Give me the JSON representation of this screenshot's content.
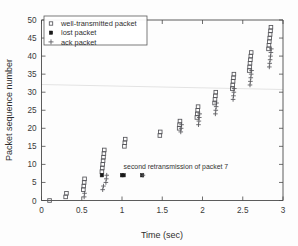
{
  "chart_data": {
    "type": "scatter",
    "title": "",
    "xlabel": "Time (sec)",
    "ylabel": "Packet sequence number",
    "xlim": [
      0,
      3
    ],
    "ylim": [
      0,
      50
    ],
    "xticks": [
      0,
      0.5,
      1,
      1.5,
      2,
      2.5,
      3
    ],
    "xticklabels": [
      "0",
      "0.5",
      "1",
      "1.5",
      "2",
      "2.5",
      "3"
    ],
    "yticks": [
      0,
      5,
      10,
      15,
      20,
      25,
      30,
      35,
      40,
      45,
      50
    ],
    "yticklabels": [
      "0",
      "5",
      "10",
      "15",
      "20",
      "25",
      "30",
      "35",
      "40",
      "45",
      "50"
    ],
    "grid": false,
    "legend_position": "upper left",
    "series": [
      {
        "name": "well-transmitted packet",
        "marker": "open-square",
        "color": "#55555a",
        "points": [
          [
            0.1,
            0
          ],
          [
            0.3,
            1
          ],
          [
            0.31,
            2
          ],
          [
            0.52,
            3
          ],
          [
            0.525,
            4
          ],
          [
            0.53,
            5
          ],
          [
            0.535,
            6
          ],
          [
            0.75,
            8
          ],
          [
            0.755,
            9
          ],
          [
            0.76,
            10
          ],
          [
            0.765,
            11
          ],
          [
            0.77,
            12
          ],
          [
            0.775,
            13
          ],
          [
            0.78,
            14
          ],
          [
            1.03,
            15
          ],
          [
            1.035,
            16
          ],
          [
            1.04,
            17
          ],
          [
            1.47,
            18
          ],
          [
            1.475,
            19
          ],
          [
            1.71,
            20
          ],
          [
            1.715,
            21
          ],
          [
            1.72,
            22
          ],
          [
            1.93,
            23
          ],
          [
            1.935,
            24
          ],
          [
            1.94,
            25
          ],
          [
            1.945,
            26
          ],
          [
            2.15,
            27
          ],
          [
            2.155,
            28
          ],
          [
            2.16,
            29
          ],
          [
            2.165,
            30
          ],
          [
            2.37,
            31
          ],
          [
            2.375,
            32
          ],
          [
            2.38,
            33
          ],
          [
            2.385,
            34
          ],
          [
            2.39,
            35
          ],
          [
            2.58,
            36
          ],
          [
            2.585,
            37
          ],
          [
            2.59,
            38
          ],
          [
            2.595,
            39
          ],
          [
            2.6,
            40
          ],
          [
            2.605,
            41
          ],
          [
            2.82,
            42
          ],
          [
            2.825,
            43
          ],
          [
            2.83,
            44
          ],
          [
            2.835,
            45
          ],
          [
            2.84,
            46
          ],
          [
            2.845,
            47
          ],
          [
            2.85,
            48
          ]
        ]
      },
      {
        "name": "lost packet",
        "marker": "filled-square",
        "color": "#1a1a1a",
        "points": [
          [
            0.75,
            7
          ],
          [
            1.0,
            7
          ],
          [
            1.02,
            7
          ],
          [
            1.25,
            7
          ]
        ]
      },
      {
        "name": "ack packet",
        "marker": "plus",
        "color": "#55555a",
        "points": [
          [
            0.53,
            1
          ],
          [
            0.535,
            2
          ],
          [
            0.76,
            3
          ],
          [
            0.77,
            4
          ],
          [
            0.8,
            5
          ],
          [
            0.805,
            6
          ],
          [
            0.81,
            7
          ],
          [
            1.26,
            7
          ],
          [
            1.73,
            19
          ],
          [
            1.735,
            20
          ],
          [
            1.74,
            21
          ],
          [
            1.95,
            21
          ],
          [
            1.955,
            22
          ],
          [
            1.96,
            23
          ],
          [
            1.965,
            24
          ],
          [
            2.16,
            24
          ],
          [
            2.165,
            25
          ],
          [
            2.17,
            26
          ],
          [
            2.175,
            27
          ],
          [
            2.38,
            28
          ],
          [
            2.385,
            29
          ],
          [
            2.39,
            30
          ],
          [
            2.395,
            31
          ],
          [
            2.59,
            32
          ],
          [
            2.595,
            33
          ],
          [
            2.6,
            34
          ],
          [
            2.605,
            35
          ],
          [
            2.61,
            36
          ],
          [
            2.83,
            37
          ],
          [
            2.835,
            38
          ],
          [
            2.84,
            39
          ],
          [
            2.845,
            40
          ],
          [
            2.85,
            41
          ],
          [
            2.855,
            42
          ]
        ]
      }
    ],
    "annotations": [
      {
        "text": "second retransmission of packet 7",
        "x": 1.02,
        "y": 8.6
      }
    ]
  },
  "legend": {
    "entries": [
      {
        "label": "well-transmitted packet",
        "marker": "open-square"
      },
      {
        "label": "lost packet",
        "marker": "filled-square"
      },
      {
        "label": "ack packet",
        "marker": "plus"
      }
    ]
  }
}
